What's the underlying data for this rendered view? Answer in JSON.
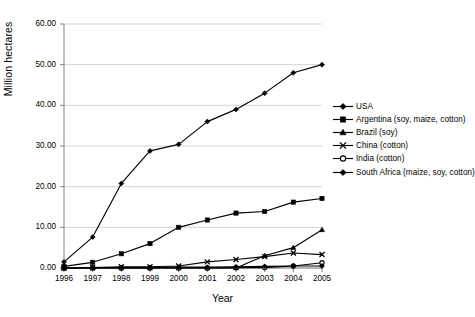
{
  "chart_data": {
    "type": "line",
    "title": "",
    "xlabel": "Year",
    "ylabel": "Million hectares",
    "x": [
      1996,
      1997,
      1998,
      1999,
      2000,
      2001,
      2002,
      2003,
      2004,
      2005
    ],
    "xtick_labels": [
      "1996",
      "1997",
      "1998",
      "1999",
      "2000",
      "2001",
      "2002",
      "2003",
      "2004",
      "2005"
    ],
    "ytick_labels": [
      "0.00",
      "10.00",
      "20.00",
      "30.00",
      "40.00",
      "50.00",
      "60.00"
    ],
    "ylim": [
      0,
      60
    ],
    "ytick_step": 10,
    "grid": "horizontal",
    "legend_position": "right",
    "series": [
      {
        "name": "USA",
        "marker": "diamond",
        "values": [
          1.5,
          7.6,
          20.8,
          28.8,
          30.4,
          36.0,
          39.0,
          43.0,
          48.0,
          50.0
        ]
      },
      {
        "name": "Argentina (soy, maize, cotton)",
        "marker": "square",
        "values": [
          0.4,
          1.4,
          3.5,
          6.0,
          10.0,
          11.8,
          13.5,
          13.9,
          16.2,
          17.1
        ]
      },
      {
        "name": "Brazil (soy)",
        "marker": "triangle",
        "values": [
          0.0,
          0.0,
          0.0,
          0.0,
          0.0,
          0.0,
          0.0,
          3.0,
          5.0,
          9.4
        ]
      },
      {
        "name": "China (cotton)",
        "marker": "cross",
        "values": [
          0.0,
          0.1,
          0.3,
          0.3,
          0.5,
          1.5,
          2.1,
          2.8,
          3.7,
          3.3
        ]
      },
      {
        "name": "India (cotton)",
        "marker": "open-circle",
        "values": [
          0.0,
          0.0,
          0.0,
          0.0,
          0.0,
          0.0,
          0.1,
          0.1,
          0.5,
          1.3
        ]
      },
      {
        "name": "South Africa (maize, soy, cotton)",
        "marker": "filled-diamond",
        "values": [
          0.0,
          0.1,
          0.1,
          0.1,
          0.2,
          0.2,
          0.3,
          0.4,
          0.5,
          0.5
        ]
      }
    ]
  },
  "legend": {
    "items": [
      {
        "label": "USA",
        "marker": "diamond"
      },
      {
        "label": "Argentina (soy, maize, cotton)",
        "marker": "square"
      },
      {
        "label": "Brazil (soy)",
        "marker": "triangle"
      },
      {
        "label": "China (cotton)",
        "marker": "cross"
      },
      {
        "label": "India (cotton)",
        "marker": "open-circle"
      },
      {
        "label": "South Africa (maize, soy, cotton)",
        "marker": "filled-diamond"
      }
    ]
  },
  "colors": {
    "series": "#000000",
    "grid": "#c6c6c6",
    "axis": "#808080",
    "background": "#ffffff"
  }
}
